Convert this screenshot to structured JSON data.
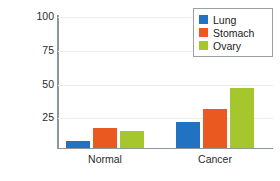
{
  "chart_data": {
    "type": "bar",
    "title": "",
    "xlabel": "",
    "ylabel": "Cells dividing",
    "categories": [
      "Normal",
      "Cancer"
    ],
    "series": [
      {
        "name": "Lung",
        "color": "#2272c4",
        "values": [
          5,
          20
        ]
      },
      {
        "name": "Stomach",
        "color": "#ea5a20",
        "values": [
          15,
          30
        ]
      },
      {
        "name": "Ovary",
        "color": "#a6c62e",
        "values": [
          13,
          46
        ]
      }
    ],
    "ylim": [
      0,
      100
    ],
    "yticks": [
      0,
      25,
      50,
      75,
      100
    ],
    "ytick_labels": [
      "",
      "25",
      "50",
      "75",
      "100"
    ],
    "grid": "horizontal",
    "legend_position": "top-right"
  },
  "axis": {
    "y_title": "Cells dividing",
    "tick_100": "100",
    "tick_75": "75",
    "tick_50": "50",
    "tick_25": "25"
  },
  "categories": {
    "normal": "Normal",
    "cancer": "Cancer"
  },
  "legend": {
    "lung": "Lung",
    "stomach": "Stomach",
    "ovary": "Ovary"
  },
  "colors": {
    "lung": "#2272c4",
    "stomach": "#ea5a20",
    "ovary": "#a6c62e",
    "axis": "#8d9699",
    "grid": "#e9eef0",
    "text": "#1b1b1b",
    "background": "#ffffff"
  }
}
